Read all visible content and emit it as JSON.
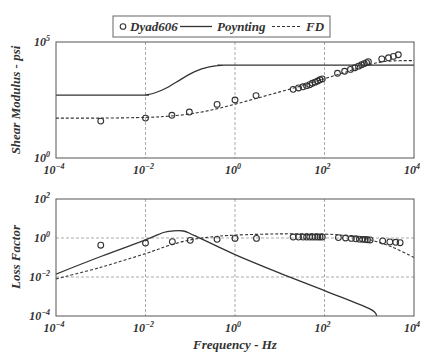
{
  "legend": {
    "entries": [
      {
        "label": "Dyad606",
        "style": "marker-circle"
      },
      {
        "label": "Poynting",
        "style": "solid"
      },
      {
        "label": "FD",
        "style": "dashed"
      }
    ]
  },
  "colors": {
    "line": "#333333",
    "grid": "#888888",
    "axis": "#555555",
    "background": "#ffffff"
  },
  "chart_data": [
    {
      "type": "line",
      "title": "",
      "xlabel": "",
      "ylabel": "Shear Modulus - psi",
      "xscale": "log",
      "yscale": "log",
      "xlim": [
        0.0001,
        10000
      ],
      "ylim": [
        1,
        100000
      ],
      "x_ticks": [
        {
          "base": "10",
          "exp": "-4"
        },
        {
          "base": "10",
          "exp": "-2"
        },
        {
          "base": "10",
          "exp": "0"
        },
        {
          "base": "10",
          "exp": "2"
        },
        {
          "base": "10",
          "exp": "4"
        }
      ],
      "y_ticks": [
        {
          "base": "10",
          "exp": "5",
          "log": 5
        },
        {
          "base": "10",
          "exp": "0",
          "log": 0
        }
      ],
      "grid": {
        "vertical": true,
        "horizontal": false,
        "x_log": [
          -2,
          0,
          2
        ],
        "y_log": []
      },
      "series": [
        {
          "name": "Dyad606",
          "style": "marker-circle",
          "log_points": [
            [
              -3.0,
              1.59
            ],
            [
              -2.0,
              1.72
            ],
            [
              -1.41,
              1.84
            ],
            [
              -1.02,
              1.98
            ],
            [
              -0.4,
              2.31
            ],
            [
              0.0,
              2.5
            ],
            [
              0.47,
              2.69
            ],
            [
              1.3,
              2.96
            ],
            [
              1.42,
              3.02
            ],
            [
              1.52,
              3.07
            ],
            [
              1.6,
              3.11
            ],
            [
              1.67,
              3.16
            ],
            [
              1.73,
              3.22
            ],
            [
              1.79,
              3.27
            ],
            [
              1.85,
              3.32
            ],
            [
              1.9,
              3.37
            ],
            [
              1.95,
              3.41
            ],
            [
              2.29,
              3.65
            ],
            [
              2.45,
              3.74
            ],
            [
              2.58,
              3.82
            ],
            [
              2.68,
              3.89
            ],
            [
              2.76,
              3.96
            ],
            [
              2.83,
              4.02
            ],
            [
              2.89,
              4.07
            ],
            [
              2.94,
              4.11
            ],
            [
              2.98,
              4.15
            ],
            [
              3.28,
              4.27
            ],
            [
              3.43,
              4.32
            ],
            [
              3.54,
              4.38
            ],
            [
              3.65,
              4.45
            ]
          ]
        },
        {
          "name": "Poynting",
          "style": "solid",
          "log_points": [
            [
              -4,
              2.71
            ],
            [
              -2.1,
              2.71
            ],
            [
              -2.0,
              2.72
            ],
            [
              -1.8,
              2.8
            ],
            [
              -1.5,
              3.05
            ],
            [
              -1.2,
              3.4
            ],
            [
              -0.9,
              3.72
            ],
            [
              -0.6,
              3.92
            ],
            [
              -0.3,
              3.99
            ],
            [
              0,
              4.0
            ],
            [
              4,
              4.0
            ]
          ]
        },
        {
          "name": "FD",
          "style": "dashed",
          "log_points": [
            [
              -4,
              1.72
            ],
            [
              -3,
              1.72
            ],
            [
              -2,
              1.75
            ],
            [
              -1.5,
              1.8
            ],
            [
              -1,
              1.9
            ],
            [
              -0.5,
              2.08
            ],
            [
              0,
              2.32
            ],
            [
              0.5,
              2.58
            ],
            [
              1,
              2.85
            ],
            [
              1.5,
              3.12
            ],
            [
              2,
              3.42
            ],
            [
              2.5,
              3.72
            ],
            [
              3,
              4.02
            ],
            [
              3.3,
              4.15
            ],
            [
              3.6,
              4.19
            ],
            [
              4,
              4.2
            ]
          ]
        }
      ]
    },
    {
      "type": "line",
      "title": "",
      "xlabel": "Frequency - Hz",
      "ylabel": "Loss Factor",
      "xscale": "log",
      "yscale": "log",
      "xlim": [
        0.0001,
        10000
      ],
      "ylim": [
        0.0001,
        100
      ],
      "x_ticks": [
        {
          "base": "10",
          "exp": "-4"
        },
        {
          "base": "10",
          "exp": "-2"
        },
        {
          "base": "10",
          "exp": "0"
        },
        {
          "base": "10",
          "exp": "2"
        },
        {
          "base": "10",
          "exp": "4"
        }
      ],
      "y_ticks": [
        {
          "base": "10",
          "exp": "2",
          "log": 2
        },
        {
          "base": "10",
          "exp": "0",
          "log": 0
        },
        {
          "base": "10",
          "exp": "-2",
          "log": -2
        },
        {
          "base": "10",
          "exp": "-4",
          "log": -4
        }
      ],
      "grid": {
        "vertical": true,
        "horizontal": true,
        "x_log": [
          -2,
          0,
          2
        ],
        "y_log": [
          0,
          -2
        ]
      },
      "series": [
        {
          "name": "Dyad606",
          "style": "marker-circle",
          "log_points": [
            [
              -3.0,
              -0.37
            ],
            [
              -2.0,
              -0.26
            ],
            [
              -1.4,
              -0.19
            ],
            [
              -1.0,
              -0.12
            ],
            [
              -0.4,
              -0.07
            ],
            [
              0.0,
              -0.02
            ],
            [
              0.48,
              -0.02
            ],
            [
              1.3,
              0.05
            ],
            [
              1.42,
              0.05
            ],
            [
              1.52,
              0.05
            ],
            [
              1.6,
              0.05
            ],
            [
              1.67,
              0.05
            ],
            [
              1.73,
              0.05
            ],
            [
              1.79,
              0.05
            ],
            [
              1.85,
              0.05
            ],
            [
              1.9,
              0.05
            ],
            [
              1.95,
              0.05
            ],
            [
              2.31,
              0.02
            ],
            [
              2.47,
              0.0
            ],
            [
              2.6,
              -0.02
            ],
            [
              2.7,
              -0.04
            ],
            [
              2.78,
              -0.06
            ],
            [
              2.85,
              -0.07
            ],
            [
              2.91,
              -0.08
            ],
            [
              2.96,
              -0.09
            ],
            [
              3.02,
              -0.1
            ],
            [
              3.3,
              -0.15
            ],
            [
              3.46,
              -0.2
            ],
            [
              3.59,
              -0.22
            ],
            [
              3.69,
              -0.24
            ]
          ]
        },
        {
          "name": "Poynting",
          "style": "solid",
          "log_points": [
            [
              -4,
              -1.85
            ],
            [
              -3,
              -0.95
            ],
            [
              -2,
              -0.1
            ],
            [
              -1.6,
              0.28
            ],
            [
              -1.4,
              0.36
            ],
            [
              -1.15,
              0.36
            ],
            [
              -0.9,
              0.12
            ],
            [
              0,
              -0.85
            ],
            [
              1,
              -1.8
            ],
            [
              2,
              -2.7
            ],
            [
              3,
              -3.62
            ],
            [
              3.17,
              -4.0
            ]
          ]
        },
        {
          "name": "FD",
          "style": "dashed",
          "log_points": [
            [
              -4,
              -2.1
            ],
            [
              -3,
              -1.5
            ],
            [
              -2,
              -0.8
            ],
            [
              -1.5,
              -0.4
            ],
            [
              -1,
              -0.1
            ],
            [
              -0.5,
              0.06
            ],
            [
              0,
              0.15
            ],
            [
              1,
              0.21
            ],
            [
              2,
              0.2
            ],
            [
              2.5,
              0.12
            ],
            [
              3,
              -0.08
            ],
            [
              3.5,
              -0.45
            ],
            [
              4,
              -1.0
            ]
          ]
        }
      ]
    }
  ]
}
